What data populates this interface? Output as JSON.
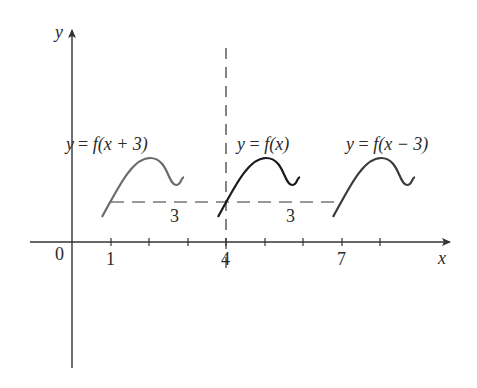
{
  "figure": {
    "axes": {
      "x_label": "x",
      "y_label": "y",
      "origin_label": "0",
      "x_tick_labels": [
        {
          "value": 1,
          "label": "1"
        },
        {
          "value": 4,
          "label": "4"
        },
        {
          "value": 7,
          "label": "7"
        }
      ],
      "x_ticks": [
        1,
        2,
        3,
        4,
        5,
        6,
        7,
        8
      ]
    },
    "curves": [
      {
        "name": "shifted-left",
        "label": "y = f(x + 3)",
        "color": "#6b6b6b",
        "x_start": 0.8
      },
      {
        "name": "original",
        "label": "y = f(x)",
        "color": "#1a1a1a",
        "x_start": 3.8
      },
      {
        "name": "shifted-right",
        "label": "y = f(x − 3)",
        "color": "#3a3a3a",
        "x_start": 6.8
      }
    ],
    "shift_annotations": [
      {
        "label": "3",
        "from": 1,
        "to": 4
      },
      {
        "label": "3",
        "from": 4,
        "to": 7
      }
    ],
    "reference_line_x": 4,
    "colors": {
      "axis": "#333333",
      "dash": "#333333",
      "text": "#2a2a2a"
    }
  },
  "text": {
    "y_axis": "y",
    "x_axis": "x",
    "origin": "0",
    "tick_1": "1",
    "tick_4": "4",
    "tick_7": "7",
    "label_left_y": "y",
    "label_left_eq": "= ",
    "label_left_f": "f",
    "label_left_arg": "(x + 3)",
    "label_mid_y": "y",
    "label_mid_eq": " = ",
    "label_mid_f": "f",
    "label_mid_arg": "(x)",
    "label_right_y": "y",
    "label_right_eq": " = ",
    "label_right_f": "f",
    "label_right_arg": "(x − 3)",
    "shift_1": "3",
    "shift_2": "3"
  }
}
